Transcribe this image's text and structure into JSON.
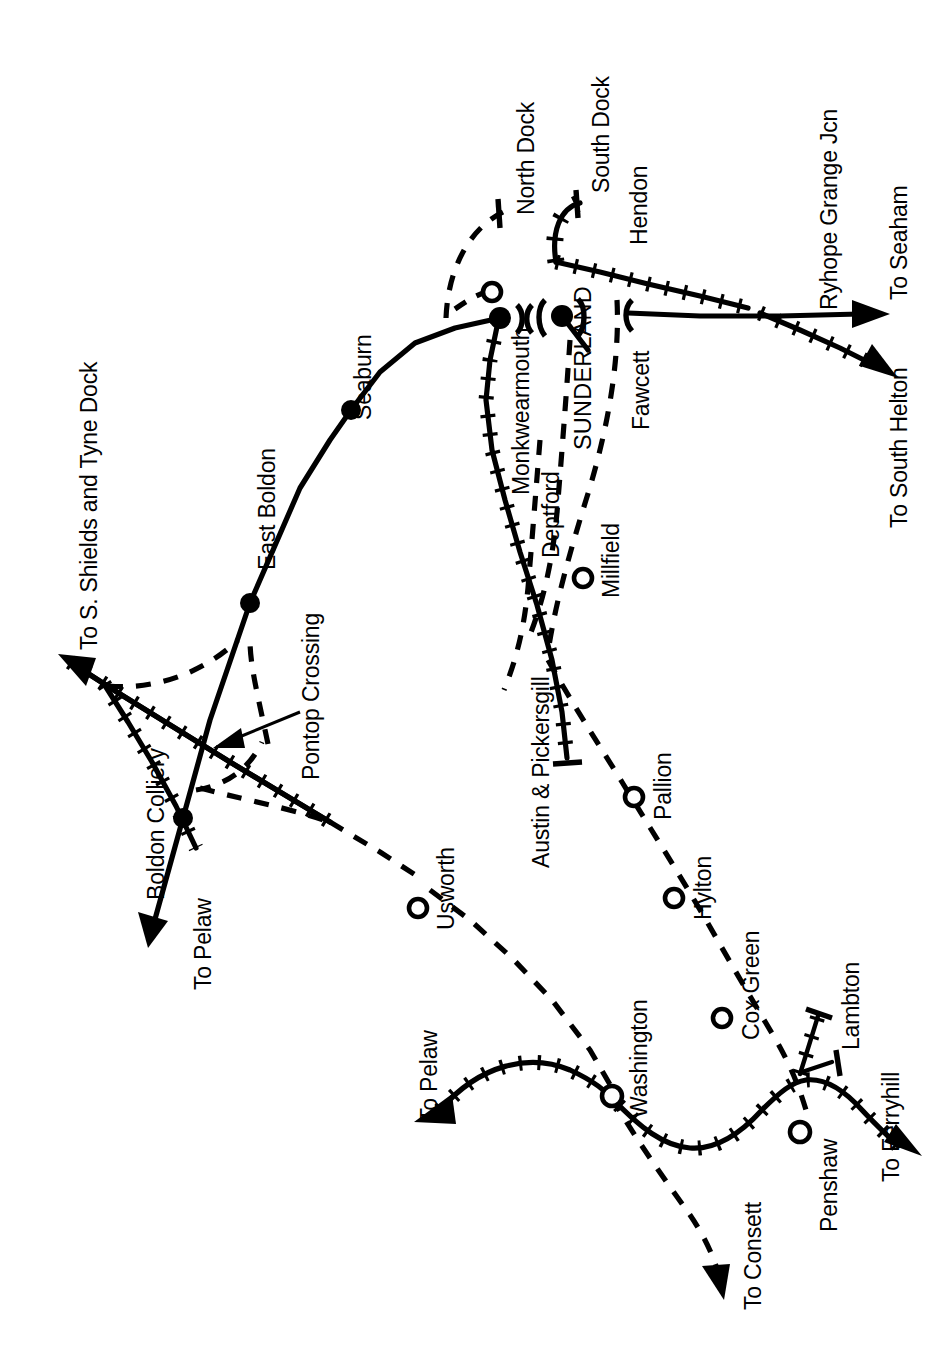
{
  "diagram": {
    "orientation": "labels rotated 90 degrees (sideways printed map)",
    "line_colour": "#000000",
    "background_colour": "#ffffff"
  },
  "stations": [
    {
      "name": "Seaburn",
      "marker": "filled-dot"
    },
    {
      "name": "East Boldon",
      "marker": "filled-dot"
    },
    {
      "name": "Boldon Colliery",
      "marker": "filled-dot"
    },
    {
      "name": "Monkwearmouth",
      "marker": "filled-dot"
    },
    {
      "name": "SUNDERLAND",
      "marker": "filled-dot"
    },
    {
      "name": "North Dock",
      "marker": "none"
    },
    {
      "name": "South Dock",
      "marker": "none"
    },
    {
      "name": "Hendon",
      "marker": "none"
    },
    {
      "name": "Fawcett",
      "marker": "none"
    },
    {
      "name": "Deptford",
      "marker": "none"
    },
    {
      "name": "Millfield",
      "marker": "open-circle"
    },
    {
      "name": "Austin & Pickersgill",
      "marker": "none"
    },
    {
      "name": "Pallion",
      "marker": "open-circle"
    },
    {
      "name": "Hylton",
      "marker": "open-circle"
    },
    {
      "name": "Cox Green",
      "marker": "open-circle"
    },
    {
      "name": "Usworth",
      "marker": "open-circle"
    },
    {
      "name": "Washington",
      "marker": "open-circle"
    },
    {
      "name": "Penshaw",
      "marker": "open-circle"
    },
    {
      "name": "Lambton",
      "marker": "none"
    },
    {
      "name": "Ryhope Grange Jcn",
      "marker": "none"
    },
    {
      "name": "Pontop Crossing",
      "marker": "leader-arrow"
    }
  ],
  "destinations": [
    {
      "label": "To S. Shields and Tyne Dock"
    },
    {
      "label": "To Pelaw"
    },
    {
      "label": "To Pelaw"
    },
    {
      "label": "To Seaham"
    },
    {
      "label": "To South Helton"
    },
    {
      "label": "To Consett"
    },
    {
      "label": "To Ferryhill"
    }
  ],
  "labels": {
    "to_s_shields_and_tyne_dock": "To S. Shields and Tyne Dock",
    "east_boldon": "East Boldon",
    "seaburn": "Seaburn",
    "boldon_colliery": "Boldon Colliery",
    "to_pelaw_north": "To Pelaw",
    "pontop_crossing": "Pontop Crossing",
    "north_dock": "North Dock",
    "south_dock": "South Dock",
    "hendon": "Hendon",
    "monkwearmouth": "Monkwearmouth",
    "sunderland": "SUNDERLAND",
    "fawcett": "Fawcett",
    "ryhope_grange_jcn": "Ryhope Grange Jcn",
    "to_seaham": "To Seaham",
    "to_south_helton": "To South Helton",
    "deptford": "Deptford",
    "millfield": "Millfield",
    "austin_and_pickersgill": "Austin & Pickersgill",
    "pallion": "Pallion",
    "hylton": "Hylton",
    "usworth": "Usworth",
    "cox_green": "Cox Green",
    "washington": "Washington",
    "to_pelaw_south": "To Pelaw",
    "to_consett": "To Consett",
    "penshaw": "Penshaw",
    "lambton": "Lambton",
    "to_ferryhill": "To Ferryhill"
  }
}
